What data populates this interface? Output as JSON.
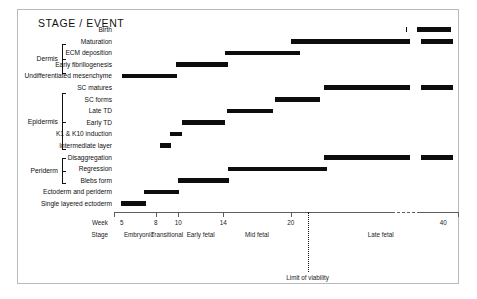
{
  "figure": {
    "title": "STAGE / EVENT"
  },
  "groups": [
    {
      "name": "Dermis",
      "top": 44,
      "height": 30
    },
    {
      "name": "Epidermis",
      "top": 93,
      "height": 57
    },
    {
      "name": "Periderm",
      "top": 158,
      "height": 26
    }
  ],
  "axis": {
    "week_word": "Week",
    "stage_word": "Stage",
    "ticks": [
      {
        "label": "5",
        "week": 5
      },
      {
        "label": "8",
        "week": 8
      },
      {
        "label": "10",
        "week": 10
      },
      {
        "label": "14",
        "week": 14
      },
      {
        "label": "20",
        "week": 20
      },
      {
        "label": "40",
        "week": 40
      }
    ],
    "stages": [
      {
        "label": "Embryonic",
        "week": 6.5
      },
      {
        "label": "Transitional",
        "week": 9.0
      },
      {
        "label": "Early fetal",
        "week": 12.0
      },
      {
        "label": "Mid fetal",
        "week": 17.0
      },
      {
        "label": "Late fetal",
        "week": 28.0
      }
    ],
    "viability": {
      "label": "Limit of viability",
      "week": 21.5
    },
    "range": [
      4.3,
      41.0
    ]
  },
  "chart_data": {
    "type": "bar",
    "title": "STAGE / EVENT",
    "xlabel": "Week",
    "ylabel": "Stage / Event",
    "xlim": [
      4.3,
      41.0
    ],
    "grid": false,
    "legend": null,
    "bar_orientation": "horizontal-gantt",
    "annotations": [
      "Limit of viability at week ~21.5",
      "Axis break between week 30 and 38"
    ],
    "rows": [
      {
        "label": "Birth",
        "group": "Dermis",
        "spans": [
          [
            36.2,
            36.9
          ],
          [
            38.3,
            40.5
          ]
        ]
      },
      {
        "label": "Maturation",
        "group": "Dermis",
        "spans": [
          [
            20.0,
            34.5
          ],
          [
            35.6,
            36.3
          ],
          [
            37.2,
            37.9
          ],
          [
            38.6,
            40.6
          ]
        ]
      },
      {
        "label": "ECM deposition",
        "group": "Dermis",
        "spans": [
          [
            14.2,
            20.8
          ]
        ]
      },
      {
        "label": "Early fibrillogenesis",
        "group": "Dermis",
        "spans": [
          [
            9.8,
            14.4
          ]
        ]
      },
      {
        "label": "Undifferentiated mesenchyme",
        "group": null,
        "spans": [
          [
            5.0,
            9.9
          ]
        ]
      },
      {
        "label": "SC matures",
        "group": "Epidermis",
        "spans": [
          [
            23.0,
            34.5
          ],
          [
            35.6,
            36.3
          ],
          [
            37.2,
            37.9
          ],
          [
            38.6,
            40.6
          ]
        ]
      },
      {
        "label": "SC forms",
        "group": "Epidermis",
        "spans": [
          [
            18.6,
            22.6
          ]
        ]
      },
      {
        "label": "Late TD",
        "group": "Epidermis",
        "spans": [
          [
            14.3,
            18.4
          ]
        ]
      },
      {
        "label": "Early TD",
        "group": "Epidermis",
        "spans": [
          [
            10.3,
            14.2
          ]
        ]
      },
      {
        "label": "K1 & K10 induction",
        "group": "Epidermis",
        "spans": [
          [
            9.3,
            10.3
          ]
        ]
      },
      {
        "label": "Intermediate layer",
        "group": "Epidermis",
        "spans": [
          [
            8.4,
            9.4
          ]
        ]
      },
      {
        "label": "Disaggregation",
        "group": "Periderm",
        "spans": [
          [
            23.0,
            34.5
          ],
          [
            35.6,
            36.3
          ],
          [
            37.2,
            37.9
          ],
          [
            38.6,
            40.6
          ]
        ]
      },
      {
        "label": "Regression",
        "group": "Periderm",
        "spans": [
          [
            14.4,
            23.2
          ]
        ]
      },
      {
        "label": "Blebs form",
        "group": "Periderm",
        "spans": [
          [
            10.0,
            14.5
          ]
        ]
      },
      {
        "label": "Ectoderm and periderm",
        "group": null,
        "spans": [
          [
            7.0,
            10.1
          ]
        ]
      },
      {
        "label": "Single layered ectoderm",
        "group": null,
        "spans": [
          [
            4.9,
            7.1
          ]
        ]
      }
    ]
  }
}
